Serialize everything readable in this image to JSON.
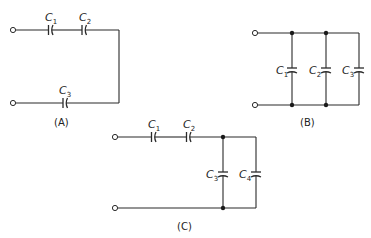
{
  "figure": {
    "circuits": [
      {
        "id": "A",
        "caption": "(A)",
        "description": "C1 and C2 in series on top wire, looping down to C3 in series on bottom wire",
        "capacitors": [
          {
            "label": "C",
            "sub": "1"
          },
          {
            "label": "C",
            "sub": "2"
          },
          {
            "label": "C",
            "sub": "3"
          }
        ]
      },
      {
        "id": "B",
        "caption": "(B)",
        "description": "C1, C2, C3 in parallel between two terminals",
        "capacitors": [
          {
            "label": "C",
            "sub": "1"
          },
          {
            "label": "C",
            "sub": "2"
          },
          {
            "label": "C",
            "sub": "3"
          }
        ]
      },
      {
        "id": "C",
        "caption": "(C)",
        "description": "C1 and C2 in series feeding C3 and C4 in parallel",
        "capacitors": [
          {
            "label": "C",
            "sub": "1"
          },
          {
            "label": "C",
            "sub": "2"
          },
          {
            "label": "C",
            "sub": "3"
          },
          {
            "label": "C",
            "sub": "4"
          }
        ]
      }
    ]
  }
}
